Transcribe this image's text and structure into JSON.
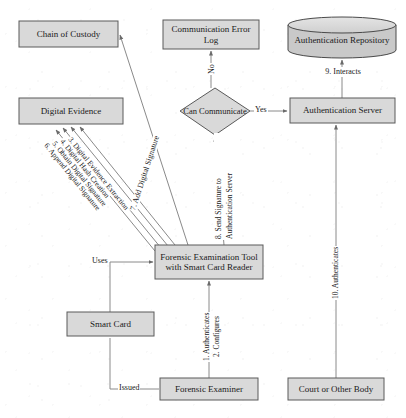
{
  "diagram": {
    "style": {
      "node_fill": "#d9d9d9",
      "node_stroke": "#555555",
      "line_color": "#7a7a7a",
      "background": "#ffffff",
      "text_color": "#1a1a1a"
    },
    "nodes": [
      {
        "id": "chain_of_custody",
        "label": "Chain of Custody",
        "shape": "rectangle",
        "x": 19,
        "y": 21,
        "w": 99,
        "h": 26
      },
      {
        "id": "comm_error_log",
        "label": "Communication Error Log",
        "shape": "rectangle",
        "x": 163,
        "y": 20,
        "w": 96,
        "h": 29
      },
      {
        "id": "auth_repository",
        "label": "Authentication Repository",
        "shape": "cylinder",
        "x": 288,
        "y": 17,
        "w": 108,
        "h": 41
      },
      {
        "id": "digital_evidence",
        "label": "Digital Evidence",
        "shape": "rectangle",
        "x": 19,
        "y": 98,
        "w": 104,
        "h": 26
      },
      {
        "id": "can_communicate",
        "label": "Can Communicate",
        "shape": "diamond",
        "x": 180,
        "y": 88,
        "w": 70,
        "h": 47
      },
      {
        "id": "auth_server",
        "label": "Authentication Server",
        "shape": "rectangle",
        "x": 290,
        "y": 98,
        "w": 105,
        "h": 25
      },
      {
        "id": "forensic_tool",
        "label": "Forensic Examination Tool with Smart Card Reader",
        "shape": "rectangle",
        "x": 155,
        "y": 245,
        "w": 108,
        "h": 34
      },
      {
        "id": "smart_card",
        "label": "Smart Card",
        "shape": "rectangle",
        "x": 67,
        "y": 312,
        "w": 87,
        "h": 24
      },
      {
        "id": "forensic_examiner",
        "label": "Forensic Examiner",
        "shape": "rectangle",
        "x": 160,
        "y": 378,
        "w": 98,
        "h": 22
      },
      {
        "id": "court_or_other_body",
        "label": "Court or Other Body",
        "shape": "rectangle",
        "x": 288,
        "y": 378,
        "w": 96,
        "h": 22
      }
    ],
    "edges": [
      {
        "id": "e_tool_to_chain",
        "from": "forensic_tool",
        "to": "chain_of_custody",
        "label": "7. Add Digital Signature",
        "orientation": "diagonal"
      },
      {
        "id": "e_diamond_to_log",
        "from": "can_communicate",
        "to": "comm_error_log",
        "label": "No",
        "orientation": "vertical"
      },
      {
        "id": "e_diamond_to_server",
        "from": "can_communicate",
        "to": "auth_server",
        "label": "Yes",
        "orientation": "horizontal"
      },
      {
        "id": "e_server_to_repo",
        "from": "auth_server",
        "to": "auth_repository",
        "label": "9. Interacts",
        "orientation": "vertical"
      },
      {
        "id": "e_tool_to_diamond",
        "from": "forensic_tool",
        "to": "can_communicate",
        "label": "8. Send Signature to Authentication Server",
        "orientation": "vertical"
      },
      {
        "id": "e_ev_1",
        "from": "forensic_tool",
        "to": "digital_evidence",
        "label": "3. Digital Evidence Extraction",
        "orientation": "diagonal"
      },
      {
        "id": "e_ev_2",
        "from": "forensic_tool",
        "to": "digital_evidence",
        "label": "4. Digital Hash Creation",
        "orientation": "diagonal"
      },
      {
        "id": "e_ev_3",
        "from": "forensic_tool",
        "to": "digital_evidence",
        "label": "5. Obtain Digital Signature",
        "orientation": "diagonal"
      },
      {
        "id": "e_ev_4",
        "from": "forensic_tool",
        "to": "digital_evidence",
        "label": "6. Append Digital Signature",
        "orientation": "diagonal"
      },
      {
        "id": "e_card_to_tool",
        "from": "smart_card",
        "to": "forensic_tool",
        "label": "Uses",
        "orientation": "elbow"
      },
      {
        "id": "e_examiner_auth",
        "from": "forensic_examiner",
        "to": "forensic_tool",
        "label": "1. Authenticates",
        "orientation": "vertical"
      },
      {
        "id": "e_examiner_conf",
        "from": "forensic_examiner",
        "to": "forensic_tool",
        "label": "2. Configures",
        "orientation": "vertical"
      },
      {
        "id": "e_examiner_card",
        "from": "forensic_examiner",
        "to": "smart_card",
        "label": "Issued",
        "orientation": "elbow"
      },
      {
        "id": "e_court_to_server",
        "from": "court_or_other_body",
        "to": "auth_server",
        "label": "10. Authenticates",
        "orientation": "vertical"
      }
    ]
  }
}
